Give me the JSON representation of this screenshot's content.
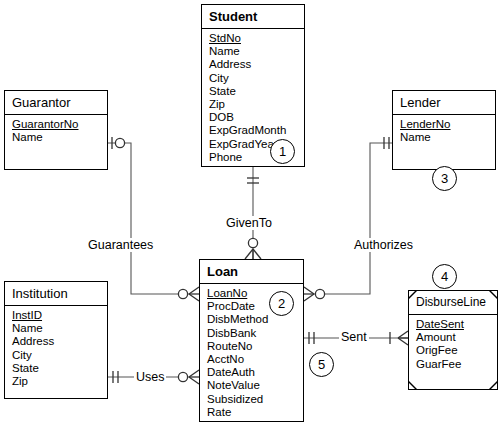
{
  "diagram": {
    "notation": "crows-foot",
    "background_color": "#ffffff",
    "line_color": "#000000",
    "entities": [
      {
        "id": "student",
        "name": "Student",
        "kind": "strong",
        "badge": "1",
        "attributes": [
          {
            "name": "StdNo",
            "key": true
          },
          {
            "name": "Name",
            "key": false
          },
          {
            "name": "Address",
            "key": false
          },
          {
            "name": "City",
            "key": false
          },
          {
            "name": "State",
            "key": false
          },
          {
            "name": "Zip",
            "key": false
          },
          {
            "name": "DOB",
            "key": false
          },
          {
            "name": "ExpGradMonth",
            "key": false
          },
          {
            "name": "ExpGradYear",
            "key": false
          },
          {
            "name": "Phone",
            "key": false
          }
        ]
      },
      {
        "id": "guarantor",
        "name": "Guarantor",
        "kind": "strong",
        "badge": "",
        "attributes": [
          {
            "name": "GuarantorNo",
            "key": true
          },
          {
            "name": "Name",
            "key": false
          }
        ]
      },
      {
        "id": "lender",
        "name": "Lender",
        "kind": "strong",
        "badge": "3",
        "attributes": [
          {
            "name": "LenderNo",
            "key": true
          },
          {
            "name": "Name",
            "key": false
          }
        ]
      },
      {
        "id": "institution",
        "name": "Institution",
        "kind": "strong",
        "badge": "",
        "attributes": [
          {
            "name": "InstID",
            "key": true
          },
          {
            "name": "Name",
            "key": false
          },
          {
            "name": "Address",
            "key": false
          },
          {
            "name": "City",
            "key": false
          },
          {
            "name": "State",
            "key": false
          },
          {
            "name": "Zip",
            "key": false
          }
        ]
      },
      {
        "id": "loan",
        "name": "Loan",
        "kind": "strong",
        "badge": "2",
        "attributes": [
          {
            "name": "LoanNo",
            "key": true
          },
          {
            "name": "ProcDate",
            "key": false
          },
          {
            "name": "DisbMethod",
            "key": false
          },
          {
            "name": "DisbBank",
            "key": false
          },
          {
            "name": "RouteNo",
            "key": false
          },
          {
            "name": "AcctNo",
            "key": false
          },
          {
            "name": "DateAuth",
            "key": false
          },
          {
            "name": "NoteValue",
            "key": false
          },
          {
            "name": "Subsidized",
            "key": false
          },
          {
            "name": "Rate",
            "key": false
          }
        ]
      },
      {
        "id": "disburseline",
        "name": "DisburseLine",
        "kind": "weak",
        "badge": "",
        "attributes": [
          {
            "name": "DateSent",
            "key": true
          },
          {
            "name": "Amount",
            "key": false
          },
          {
            "name": "OrigFee",
            "key": false
          },
          {
            "name": "GuarFee",
            "key": false
          }
        ]
      }
    ],
    "relationships": [
      {
        "id": "givento",
        "label": "GivenTo",
        "from": "student",
        "to": "loan",
        "from_cardinality": "one-mandatory",
        "to_cardinality": "zero-or-many"
      },
      {
        "id": "guarantees",
        "label": "Guarantees",
        "from": "guarantor",
        "to": "loan",
        "from_cardinality": "zero-or-one",
        "to_cardinality": "zero-or-many"
      },
      {
        "id": "authorizes",
        "label": "Authorizes",
        "from": "lender",
        "to": "loan",
        "from_cardinality": "one-mandatory",
        "to_cardinality": "zero-or-many"
      },
      {
        "id": "uses",
        "label": "Uses",
        "from": "institution",
        "to": "loan",
        "from_cardinality": "one-mandatory",
        "to_cardinality": "zero-or-many"
      },
      {
        "id": "sent",
        "label": "Sent",
        "badge": "5",
        "from": "loan",
        "to": "disburseline",
        "from_cardinality": "one-mandatory",
        "to_cardinality": "one-or-many"
      }
    ],
    "badges": [
      {
        "id": "badge-student",
        "value": "1"
      },
      {
        "id": "badge-loan",
        "value": "2"
      },
      {
        "id": "badge-lender",
        "value": "3"
      },
      {
        "id": "badge-disburseline",
        "value": "4"
      },
      {
        "id": "badge-sent",
        "value": "5"
      }
    ]
  }
}
